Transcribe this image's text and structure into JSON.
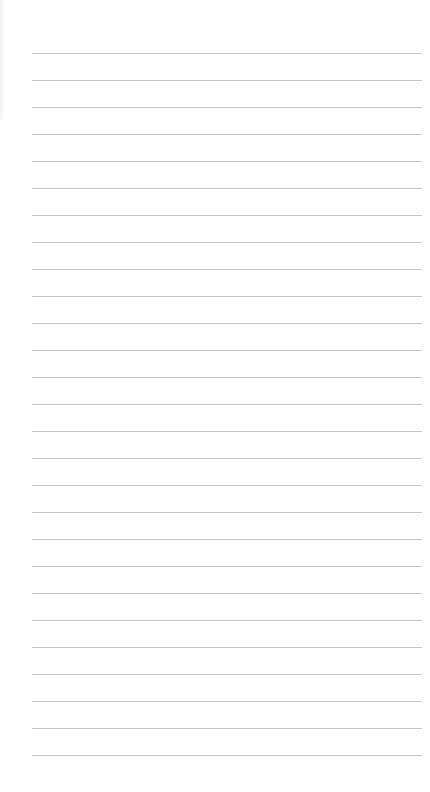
{
  "page": {
    "type": "blank-lined-paper",
    "line_color": "#c6c6c6",
    "background": "#ffffff",
    "line_count": 27,
    "first_line_y": 53,
    "line_spacing": 27
  }
}
